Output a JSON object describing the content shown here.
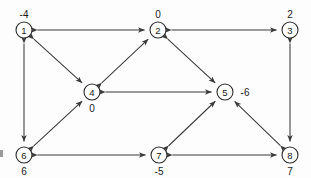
{
  "figure": {
    "background_color": "#fdfdfd",
    "node_stroke_color": "#2b2b2b",
    "edge_color": "#3a3a3a"
  },
  "nodes": [
    {
      "id": "1",
      "value": "-4",
      "cx": 24,
      "cy": 30,
      "r": 8,
      "label_pos": "above"
    },
    {
      "id": "2",
      "value": "0",
      "cx": 158,
      "cy": 30,
      "r": 8,
      "label_pos": "above"
    },
    {
      "id": "3",
      "value": "2",
      "cx": 290,
      "cy": 30,
      "r": 8,
      "label_pos": "above"
    },
    {
      "id": "4",
      "value": "0",
      "cx": 92,
      "cy": 92,
      "r": 8,
      "label_pos": "below"
    },
    {
      "id": "5",
      "value": "-6",
      "cx": 225,
      "cy": 92,
      "r": 8,
      "label_pos": "right"
    },
    {
      "id": "6",
      "value": "6",
      "cx": 24,
      "cy": 155,
      "r": 8,
      "label_pos": "below"
    },
    {
      "id": "7",
      "value": "-5",
      "cx": 159,
      "cy": 155,
      "r": 8,
      "label_pos": "below"
    },
    {
      "id": "8",
      "value": "7",
      "cx": 290,
      "cy": 155,
      "r": 8,
      "label_pos": "below"
    }
  ],
  "edges": [
    {
      "from": "1",
      "to": "2",
      "direction": "both"
    },
    {
      "from": "2",
      "to": "3",
      "direction": "both"
    },
    {
      "from": "1",
      "to": "4",
      "direction": "both"
    },
    {
      "from": "4",
      "to": "2",
      "direction": "both"
    },
    {
      "from": "2",
      "to": "5",
      "direction": "both"
    },
    {
      "from": "4",
      "to": "5",
      "direction": "both"
    },
    {
      "from": "1",
      "to": "6",
      "direction": "both"
    },
    {
      "from": "6",
      "to": "4",
      "direction": "both"
    },
    {
      "from": "3",
      "to": "8",
      "direction": "both"
    },
    {
      "from": "6",
      "to": "7",
      "direction": "both"
    },
    {
      "from": "7",
      "to": "8",
      "direction": "both"
    },
    {
      "from": "7",
      "to": "5",
      "direction": "both"
    },
    {
      "from": "8",
      "to": "5",
      "direction": "both"
    }
  ],
  "artifacts": [
    {
      "name": "edge-speck-left",
      "x": 0,
      "y": 150,
      "w": 3,
      "h": 7
    },
    {
      "name": "edge-speck-top",
      "x": 243,
      "y": 29,
      "w": 4,
      "h": 2
    }
  ]
}
